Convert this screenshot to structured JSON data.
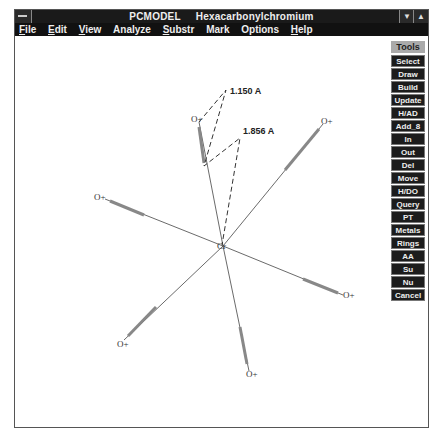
{
  "window": {
    "app_name": "PCMODEL",
    "document_title": "Hexacarbonylchromium",
    "minimize_icon": "down-triangle",
    "maximize_icon": "up-triangle"
  },
  "menu": [
    {
      "label": "File",
      "u": "F",
      "rest": "ile"
    },
    {
      "label": "Edit",
      "u": "E",
      "rest": "dit"
    },
    {
      "label": "View",
      "u": "V",
      "rest": "iew"
    },
    {
      "label": "Analyze",
      "u": "",
      "rest": "Analyze"
    },
    {
      "label": "Substr",
      "u": "S",
      "rest": "ubstr"
    },
    {
      "label": "Mark",
      "u": "",
      "rest": "Mark"
    },
    {
      "label": "Options",
      "u": "",
      "rest": "Options"
    },
    {
      "label": "Help",
      "u": "H",
      "rest": "elp"
    }
  ],
  "tools": {
    "header": "Tools",
    "buttons": [
      "Select",
      "Draw",
      "Build",
      "Update",
      "H/AD",
      "Add_8",
      "In",
      "Out",
      "Del",
      "Move",
      "H/DO",
      "Query",
      "PT",
      "Metals",
      "Rings",
      "AA",
      "Su",
      "Nu",
      "Cancel"
    ]
  },
  "molecule": {
    "center_atom": {
      "label": "Cr",
      "x": 223,
      "y": 246
    },
    "atoms": [
      {
        "label": "O+",
        "x": 197,
        "y": 119
      },
      {
        "label": "O+",
        "x": 325,
        "y": 121
      },
      {
        "label": "O+",
        "x": 98,
        "y": 197
      },
      {
        "label": "O+",
        "x": 347,
        "y": 296
      },
      {
        "label": "O+",
        "x": 121,
        "y": 344
      },
      {
        "label": "O+",
        "x": 250,
        "y": 374
      }
    ],
    "distances": [
      {
        "label": "1.150 A",
        "x": 230,
        "y": 88
      },
      {
        "label": "1.856 A",
        "x": 243,
        "y": 128
      }
    ]
  }
}
